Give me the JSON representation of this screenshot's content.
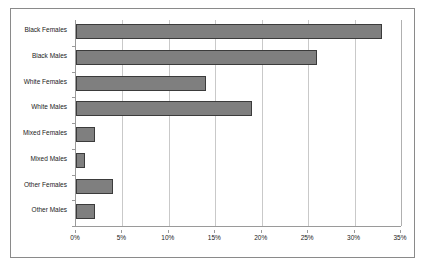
{
  "chart_data": {
    "type": "bar",
    "orientation": "horizontal",
    "title": "",
    "xlabel": "",
    "ylabel": "",
    "xlim": [
      0,
      35
    ],
    "xtick_labels": [
      "0%",
      "5%",
      "10%",
      "15%",
      "20%",
      "25%",
      "30%",
      "35%"
    ],
    "xtick_values": [
      0,
      5,
      10,
      15,
      20,
      25,
      30,
      35
    ],
    "grid": true,
    "legend": "none",
    "categories": [
      "Black Females",
      "Black Males",
      "White Females",
      "White Males",
      "Mixed Females",
      "Mixed Males",
      "Other Females",
      "Other Males"
    ],
    "values": [
      33,
      26,
      14,
      19,
      2,
      1,
      4,
      2
    ],
    "value_unit": "%",
    "bar_color": "#7f7f7f",
    "bar_border_color": "#3b3b3b",
    "gridline_color": "#c9c9c9",
    "axis_color": "#9a9a9a",
    "frame_color": "#8a8a8a",
    "background_color": "#ffffff"
  }
}
